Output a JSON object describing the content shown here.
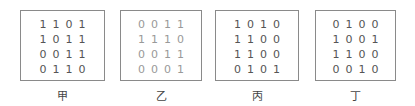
{
  "grids": [
    {
      "label": "甲",
      "rows": [
        [
          "1",
          "1",
          "0",
          "1"
        ],
        [
          "1",
          "0",
          "1",
          "1"
        ],
        [
          "0",
          "0",
          "1",
          "1"
        ],
        [
          "0",
          "1",
          "1",
          "0"
        ]
      ]
    },
    {
      "label": "乙",
      "rows": [
        [
          "0",
          "0",
          "1",
          "1"
        ],
        [
          "1",
          "1",
          "1",
          "0"
        ],
        [
          "0",
          "0",
          "1",
          "1"
        ],
        [
          "0",
          "0",
          "0",
          "1"
        ]
      ]
    },
    {
      "label": "丙",
      "rows": [
        [
          "1",
          "0",
          "1",
          "0"
        ],
        [
          "1",
          "1",
          "0",
          "0"
        ],
        [
          "1",
          "1",
          "0",
          "0"
        ],
        [
          "0",
          "1",
          "0",
          "1"
        ]
      ]
    },
    {
      "label": "丁",
      "rows": [
        [
          "0",
          "1",
          "0",
          "0"
        ],
        [
          "1",
          "0",
          "0",
          "1"
        ],
        [
          "1",
          "1",
          "0",
          "0"
        ],
        [
          "0",
          "0",
          "1",
          "0"
        ]
      ]
    }
  ]
}
